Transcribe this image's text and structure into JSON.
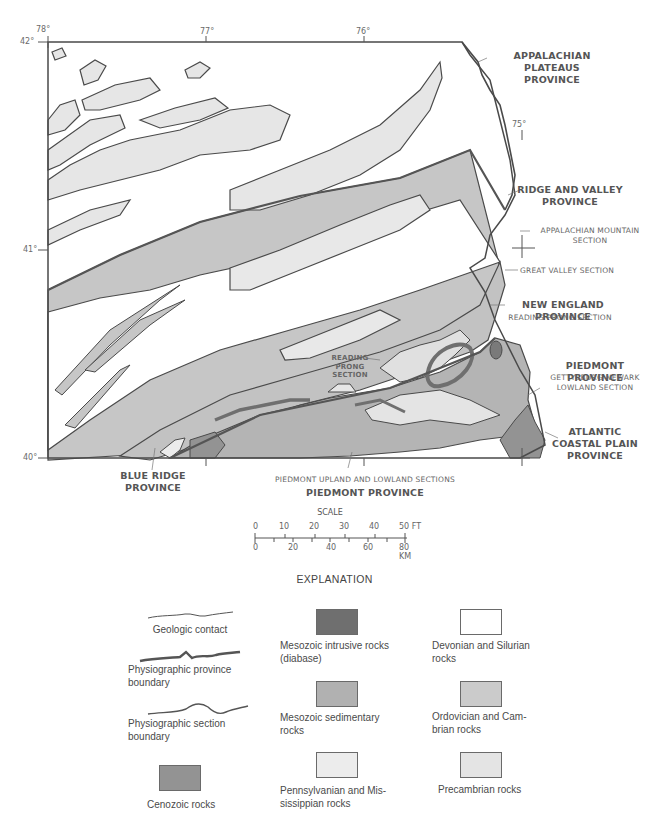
{
  "map": {
    "title": "Physiographic provinces and generalized geology of eastern Pennsylvania",
    "coordinates": {
      "lon_78": "78°",
      "lon_77": "77°",
      "lon_76": "76°",
      "lon_75": "75°",
      "lat_42": "42°",
      "lat_41": "41°",
      "lat_40": "40°"
    },
    "province_labels": {
      "appalachian_plateaus": [
        "APPALACHIAN PLATEAUS",
        "PROVINCE"
      ],
      "ridge_and_valley": [
        "RIDGE AND VALLEY",
        "PROVINCE"
      ],
      "new_england": "NEW ENGLAND PROVINCE",
      "piedmont_right": "PIEDMONT PROVINCE",
      "atlantic_coastal_plain": [
        "ATLANTIC",
        "COASTAL PLAIN",
        "PROVINCE"
      ],
      "blue_ridge": [
        "BLUE RIDGE",
        "PROVINCE"
      ],
      "piedmont_bottom": "PIEDMONT PROVINCE"
    },
    "section_labels": {
      "appalachian_mountain": [
        "APPALACHIAN MOUNTAIN",
        "SECTION"
      ],
      "great_valley": "GREAT VALLEY SECTION",
      "reading_prong_right": "READING PRONG SECTION",
      "gettysburg_newark": [
        "GETTYSBURG-NEWARK",
        "LOWLAND SECTION"
      ],
      "reading_prong_inset": [
        "READING",
        "PRONG",
        "SECTION"
      ],
      "piedmont_upland_lowland": "PIEDMONT UPLAND AND LOWLAND SECTIONS"
    },
    "colors": {
      "devonian_silurian": "#ffffff",
      "pennsylvanian_mississippian": "#e6e6e6",
      "ordovician_cambrian": "#c4c4c4",
      "mesozoic_sedimentary": "#b4b4b4",
      "mesozoic_intrusive": "#7a7a7a",
      "cenozoic": "#939393",
      "precambrian": "#e2e2e2",
      "line": "#4a4a4a"
    }
  },
  "scale": {
    "title": "SCALE",
    "ft_ticks": [
      "0",
      "10",
      "20",
      "30",
      "40",
      "50 FT"
    ],
    "km_ticks": [
      "0",
      "20",
      "40",
      "60",
      "80 KM"
    ]
  },
  "legend": {
    "title": "EXPLANATION",
    "lines": [
      {
        "label": "Geologic contact"
      },
      {
        "label_lines": [
          "Physiographic province",
          "boundary"
        ]
      },
      {
        "label_lines": [
          "Physiographic section",
          "boundary"
        ]
      }
    ],
    "units": [
      {
        "label_lines": [
          "Cenozoic rocks"
        ],
        "color": "#939393"
      },
      {
        "label_lines": [
          "Mesozoic intrusive rocks",
          "(diabase)"
        ],
        "color": "#6f6f6f"
      },
      {
        "label_lines": [
          "Mesozoic sedimentary",
          "rocks"
        ],
        "color": "#b1b1b1"
      },
      {
        "label_lines": [
          "Pennsylvanian and Mis-",
          "sissippian rocks"
        ],
        "color": "#ececec"
      },
      {
        "label_lines": [
          "Devonian and Silurian",
          "rocks"
        ],
        "color": "#ffffff"
      },
      {
        "label_lines": [
          "Ordovician and Cam-",
          "brian rocks"
        ],
        "color": "#cbcbcb"
      },
      {
        "label_lines": [
          "Precambrian rocks"
        ],
        "color": "#e4e4e4"
      }
    ]
  }
}
